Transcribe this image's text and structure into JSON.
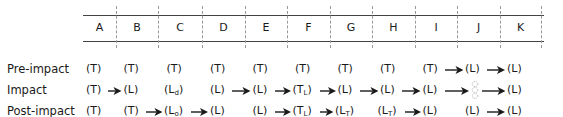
{
  "columns": [
    "A",
    "B",
    "C",
    "D",
    "E",
    "F",
    "G",
    "H",
    "I",
    "J",
    "K"
  ],
  "rows": [
    {
      "label": "Pre-impact",
      "cells": [
        {
          "col": "A",
          "text": "(T)"
        },
        {
          "col": "B",
          "text": "(T)"
        },
        {
          "col": "C",
          "text": "(T)"
        },
        {
          "col": "D",
          "text": "(T)"
        },
        {
          "col": "E",
          "text": "(T)"
        },
        {
          "col": "F",
          "text": "(T)"
        },
        {
          "col": "G",
          "text": "(T)"
        },
        {
          "col": "H",
          "text": "(T)"
        },
        {
          "col": "I",
          "text": "(T)"
        },
        {
          "col": "J",
          "text": "(L)"
        },
        {
          "col": "K",
          "text": "(L)"
        }
      ],
      "arrows": [
        "I→J",
        "J→K"
      ]
    },
    {
      "label": "Impact",
      "cells": [
        {
          "col": "A",
          "text": "(T)"
        },
        {
          "col": "B",
          "text": "(L)"
        },
        {
          "col": "C",
          "text": "(L",
          "sub": "d",
          "close": ")"
        },
        {
          "col": "D",
          "text": "(L)"
        },
        {
          "col": "E",
          "text": "(L)"
        },
        {
          "col": "F",
          "text": "(T",
          "sub": "L",
          "close": ")"
        },
        {
          "col": "G",
          "text": "(L)"
        },
        {
          "col": "H",
          "text": "(L)"
        },
        {
          "col": "I",
          "text": "(L)"
        },
        {
          "col": "J",
          "text": "",
          "ghost": true
        },
        {
          "col": "K",
          "text": "(L)"
        }
      ],
      "arrows": [
        "A→B",
        "D→E",
        "E→F",
        "F→G",
        "G→H",
        "H→I",
        "I→J",
        "J→K"
      ]
    },
    {
      "label": "Post-impact",
      "cells": [
        {
          "col": "A",
          "text": "(T)"
        },
        {
          "col": "B",
          "text": "(T)"
        },
        {
          "col": "C",
          "text": "(L",
          "sub": "o",
          "close": ")"
        },
        {
          "col": "D",
          "text": "(L)"
        },
        {
          "col": "E",
          "text": "(L)"
        },
        {
          "col": "F",
          "text": "(T",
          "sub": "L",
          "close": ")"
        },
        {
          "col": "G",
          "text": "(L",
          "sub": "T",
          "close": ")"
        },
        {
          "col": "H",
          "text": "(L",
          "sub": "T",
          "close": ")"
        },
        {
          "col": "I",
          "text": "(L)"
        },
        {
          "col": "J",
          "text": "(L)"
        },
        {
          "col": "K",
          "text": "(L)"
        }
      ],
      "arrows": [
        "B→C",
        "C→D",
        "E→F",
        "F→G",
        "H→I",
        "J→K"
      ]
    }
  ],
  "icons": {
    "arrow": "right-arrow-icon",
    "ghost": "dotted-outline-icon"
  }
}
